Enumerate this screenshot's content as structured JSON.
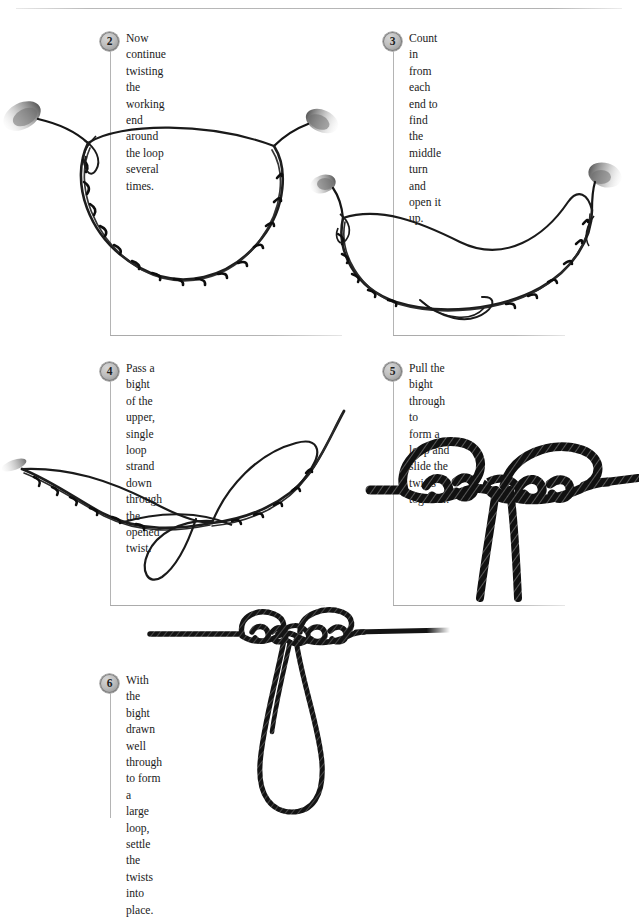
{
  "page": {
    "background_color": "#ffffff",
    "rule_color": "#b4b4b4",
    "rope_color": "#1a1a1a",
    "badge_color": "#bdbdbd"
  },
  "steps": [
    {
      "number": "2",
      "text": "Now continue twisting the working\nend around the loop several times.",
      "illustration": "twisted-loop-oval"
    },
    {
      "number": "3",
      "text": "Count in from each end to\nfind the middle turn and\nopen it up.",
      "illustration": "twisted-loop-opened-middle"
    },
    {
      "number": "4",
      "text": "Pass a bight of the upper,\nsingle loop strand down\nthrough the opened twist.",
      "illustration": "bight-passed-through-twist"
    },
    {
      "number": "5",
      "text": "Pull the bight through to\nform a loop and slide the\ntwists together.",
      "illustration": "tightened-knot-with-bight"
    },
    {
      "number": "6",
      "text": "With the bight drawn\nwell through to form a\nlarge loop, settle the\ntwists into place.",
      "illustration": "finished-knot-large-loop"
    }
  ]
}
